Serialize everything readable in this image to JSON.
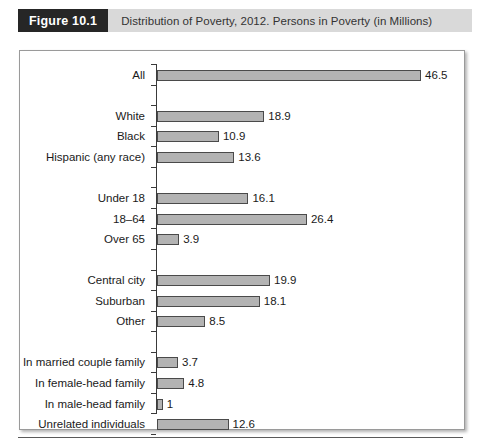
{
  "figure": {
    "number_label": "Figure 10.1",
    "title": "Distribution of Poverty, 2012. Persons in Poverty (in Millions)"
  },
  "chart_data": {
    "type": "bar",
    "orientation": "horizontal",
    "title": "Distribution of Poverty, 2012. Persons in Poverty (in Millions)",
    "xlabel": "",
    "ylabel": "",
    "xlim": [
      0,
      46.5
    ],
    "grid": false,
    "legend": null,
    "value_labels": true,
    "units": "millions of persons",
    "categories": [
      "All",
      "White",
      "Black",
      "Hispanic (any race)",
      "Under 18",
      "18–64",
      "Over 65",
      "Central city",
      "Suburban",
      "Other",
      "In married couple family",
      "In female-head family",
      "In male-head family",
      "Unrelated individuals"
    ],
    "values": [
      46.5,
      18.9,
      10.9,
      13.6,
      16.1,
      26.4,
      3.9,
      19.9,
      18.1,
      8.5,
      3.7,
      4.8,
      1,
      12.6
    ],
    "value_label_text": [
      "46.5",
      "18.9",
      "10.9",
      "13.6",
      "16.1",
      "26.4",
      "3.9",
      "19.9",
      "18.1",
      "8.5",
      "3.7",
      "4.8",
      "1",
      "12.6"
    ],
    "groups": [
      {
        "name": "total",
        "categories": [
          "All"
        ]
      },
      {
        "name": "race-ethnicity",
        "categories": [
          "White",
          "Black",
          "Hispanic (any race)"
        ]
      },
      {
        "name": "age",
        "categories": [
          "Under 18",
          "18–64",
          "Over 65"
        ]
      },
      {
        "name": "residence",
        "categories": [
          "Central city",
          "Suburban",
          "Other"
        ]
      },
      {
        "name": "family-status",
        "categories": [
          "In married couple family",
          "In female-head family",
          "In male-head family",
          "Unrelated individuals"
        ]
      }
    ],
    "bars": [
      {
        "label": "All",
        "value": 46.5,
        "value_text": "46.5",
        "slot": 0
      },
      {
        "label": "White",
        "value": 18.9,
        "value_text": "18.9",
        "slot": 2
      },
      {
        "label": "Black",
        "value": 10.9,
        "value_text": "10.9",
        "slot": 3
      },
      {
        "label": "Hispanic (any race)",
        "value": 13.6,
        "value_text": "13.6",
        "slot": 4
      },
      {
        "label": "Under 18",
        "value": 16.1,
        "value_text": "16.1",
        "slot": 6
      },
      {
        "label": "18–64",
        "value": 26.4,
        "value_text": "26.4",
        "slot": 7
      },
      {
        "label": "Over 65",
        "value": 3.9,
        "value_text": "3.9",
        "slot": 8
      },
      {
        "label": "Central city",
        "value": 19.9,
        "value_text": "19.9",
        "slot": 10
      },
      {
        "label": "Suburban",
        "value": 18.1,
        "value_text": "18.1",
        "slot": 11
      },
      {
        "label": "Other",
        "value": 8.5,
        "value_text": "8.5",
        "slot": 12
      },
      {
        "label": "In married couple family",
        "value": 3.7,
        "value_text": "3.7",
        "slot": 14
      },
      {
        "label": "In female-head family",
        "value": 4.8,
        "value_text": "4.8",
        "slot": 15
      },
      {
        "label": "In male-head family",
        "value": 1,
        "value_text": "1",
        "slot": 16
      },
      {
        "label": "Unrelated individuals",
        "value": 12.6,
        "value_text": "12.6",
        "slot": 17
      }
    ],
    "colors": {
      "bar_fill": "#b3b3b3",
      "bar_stroke": "#4a4a4a",
      "axis": "#3a3a3a",
      "text": "#1a1a1a",
      "header_block": "#262626",
      "header_band": "#d9d9d9"
    }
  }
}
